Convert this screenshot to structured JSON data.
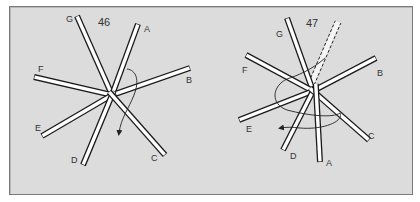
{
  "colors": {
    "panel_bg": "#dcdcdc",
    "border": "#7a7a7a",
    "stick_fill": "#ffffff",
    "stick_edge": "#1a1a1a",
    "text": "#333333"
  },
  "figures": [
    {
      "number": "46",
      "number_pos": [
        98,
        26
      ],
      "center": [
        112,
        95
      ],
      "sticks": [
        {
          "id": "G",
          "end": [
            77,
            16
          ],
          "label_pos": [
            66,
            22
          ]
        },
        {
          "id": "A",
          "end": [
            138,
            24
          ],
          "label_pos": [
            144,
            32
          ]
        },
        {
          "id": "F",
          "end": [
            34,
            77
          ],
          "label_pos": [
            38,
            72
          ]
        },
        {
          "id": "B",
          "end": [
            190,
            68
          ],
          "label_pos": [
            186,
            83
          ]
        },
        {
          "id": "E",
          "end": [
            42,
            136
          ],
          "label_pos": [
            35,
            131
          ]
        },
        {
          "id": "D",
          "end": [
            83,
            165
          ],
          "label_pos": [
            71,
            163
          ]
        },
        {
          "id": "C",
          "end": [
            165,
            155
          ],
          "label_pos": [
            151,
            161
          ]
        }
      ],
      "arrow_path": "M127,69 C136,70 140,80 134,95 C129,108 121,118 119,133"
    },
    {
      "number": "47",
      "number_pos": [
        306,
        27
      ],
      "center": [
        313,
        91
      ],
      "sticks": [
        {
          "id": "G",
          "end": [
            287,
            18
          ],
          "label_pos": [
            276,
            37
          ]
        },
        {
          "id": "F",
          "end": [
            246,
            55
          ],
          "label_pos": [
            242,
            73
          ]
        },
        {
          "id": "B",
          "end": [
            376,
            58
          ],
          "label_pos": [
            377,
            76
          ]
        },
        {
          "id": "E",
          "end": [
            239,
            120
          ],
          "label_pos": [
            246,
            132
          ]
        },
        {
          "id": "D",
          "end": [
            283,
            150
          ],
          "label_pos": [
            290,
            159
          ]
        },
        {
          "id": "C",
          "end": [
            369,
            140
          ],
          "label_pos": [
            368,
            139
          ]
        }
      ],
      "moved_stick": {
        "id": "A",
        "start": [
          316,
          88
        ],
        "end": [
          320,
          162
        ],
        "label_pos": [
          326,
          166
        ]
      },
      "ghost_stick": {
        "start": [
          313,
          80
        ],
        "end": [
          338,
          22
        ]
      },
      "arrow_path": "M325,58 C312,70 296,76 287,79 C272,86 270,104 287,110 C310,116 333,118 340,113 C344,122 322,130 300,128 C292,127 286,127 281,128"
    }
  ]
}
